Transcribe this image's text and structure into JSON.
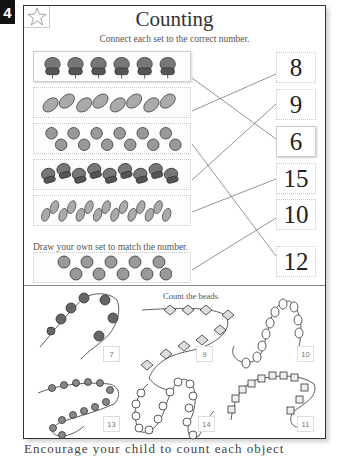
{
  "page": {
    "number_tab": "4",
    "title": "Counting",
    "instruction": "Connect each set to the correct number.",
    "draw_instruction": "Draw your own set to match the number.",
    "beads_instruction": "Count the beads.",
    "footer_partial": "Encourage your child to count each object carefully"
  },
  "icons": {
    "star": "star-icon"
  },
  "sets": [
    {
      "object": "acorn",
      "count": 6,
      "connected_to": "6"
    },
    {
      "object": "leaf",
      "count": 8,
      "connected_to": "8"
    },
    {
      "object": "berry",
      "count": 12,
      "connected_to": "12"
    },
    {
      "object": "acorn",
      "count": 9,
      "connected_to": "9"
    },
    {
      "object": "leaf",
      "count": 15,
      "connected_to": "15"
    },
    {
      "object": "berry",
      "count": 10,
      "connected_to": "10"
    }
  ],
  "numbers": [
    "8",
    "9",
    "6",
    "15",
    "10",
    "12"
  ],
  "bead_strings": [
    {
      "shape": "round-dark",
      "label": "7"
    },
    {
      "shape": "diamond",
      "label": "9"
    },
    {
      "shape": "oval-outline",
      "label": "10"
    },
    {
      "shape": "cone",
      "label": "13"
    },
    {
      "shape": "round-outline",
      "label": "14"
    },
    {
      "shape": "cube",
      "label": "11"
    }
  ]
}
